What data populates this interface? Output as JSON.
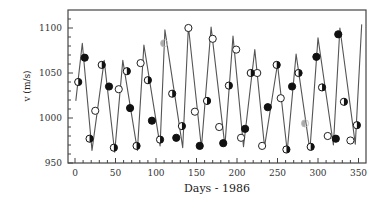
{
  "chart_data": {
    "type": "line",
    "title": "",
    "xlabel": "Days - 1986",
    "ylabel": "v (m/s)",
    "xlim": [
      -8,
      360
    ],
    "ylim": [
      950,
      1120
    ],
    "xticks": [
      0,
      50,
      100,
      150,
      200,
      250,
      300,
      350
    ],
    "yticks": [
      950,
      1000,
      1050,
      1100
    ],
    "x_minor_step": 10,
    "y_minor_step": 10,
    "grid": false,
    "legend": null,
    "series": [
      {
        "name": "model curve",
        "style": "line",
        "color": "#555555",
        "x": [
          1,
          9,
          21,
          36,
          49,
          59,
          77,
          85,
          105,
          111,
          133,
          140,
          156,
          168,
          185,
          195,
          208,
          222,
          234,
          250,
          262,
          273,
          290,
          300,
          319,
          327,
          346,
          354
        ],
        "y": [
          1019,
          1083,
          964,
          1064,
          962,
          1064,
          964,
          1081,
          969,
          1098,
          967,
          1102,
          967,
          1101,
          969,
          1091,
          968,
          1076,
          968,
          1060,
          963,
          1071,
          964,
          1089,
          970,
          1100,
          971,
          1104
        ]
      },
      {
        "name": "filled markers",
        "style": "marker-filled",
        "color": "#111111",
        "x": [
          12,
          42,
          68,
          95,
          125,
          154,
          183,
          210,
          238,
          268,
          298,
          322,
          325
        ],
        "y": [
          1067,
          1035,
          1011,
          997,
          978,
          969,
          972,
          988,
          1012,
          1035,
          1068,
          977,
          1093
        ]
      },
      {
        "name": "open markers",
        "style": "marker-open",
        "color": "#111111",
        "x": [
          25,
          54,
          81,
          140,
          148,
          170,
          178,
          199,
          205,
          225,
          231,
          254,
          312,
          340
        ],
        "y": [
          1008,
          1032,
          1061,
          1100,
          1007,
          1088,
          990,
          1076,
          978,
          1050,
          969,
          1022,
          980,
          975
        ]
      },
      {
        "name": "half-filled markers",
        "style": "marker-half",
        "color": "#111111",
        "x": [
          4,
          18,
          33,
          48,
          64,
          76,
          90,
          105,
          120,
          132,
          163,
          190,
          217,
          249,
          261,
          276,
          291,
          305,
          332,
          348
        ],
        "y": [
          1040,
          977,
          1059,
          967,
          1052,
          969,
          1042,
          976,
          1027,
          991,
          1019,
          1036,
          1050,
          1059,
          965,
          1050,
          968,
          1034,
          1018,
          992
        ]
      },
      {
        "name": "gray markers",
        "style": "marker-gray",
        "color": "#aaaaaa",
        "x": [
          110,
          284
        ],
        "y": [
          1083,
          994
        ]
      }
    ]
  },
  "axes": {
    "xlabel": "Days - 1986",
    "ylabel": "v (m/s)",
    "xtick_labels": [
      "0",
      "50",
      "100",
      "150",
      "200",
      "250",
      "300",
      "350"
    ],
    "ytick_labels": [
      "950",
      "1000",
      "1050",
      "1100"
    ]
  }
}
